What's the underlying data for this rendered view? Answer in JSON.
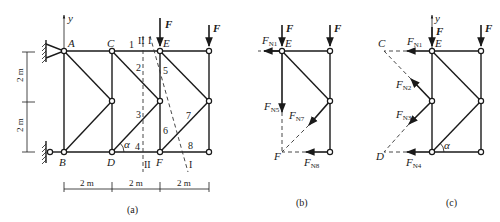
{
  "figure": {
    "panels": [
      {
        "id": "a",
        "caption": "(a)",
        "nodes": {
          "A": "A",
          "B": "B",
          "C": "C",
          "D": "D",
          "E": "E",
          "F": "F"
        },
        "axis_label": "y",
        "load_label": "F",
        "members": [
          "1",
          "2",
          "3",
          "4",
          "5",
          "6",
          "7",
          "8"
        ],
        "section_labels": {
          "I": "I",
          "II": "II"
        },
        "angle_label": "α",
        "dimensions": {
          "horizontal": [
            "2 m",
            "2 m",
            "2 m"
          ],
          "vertical": [
            "2 m",
            "2 m"
          ]
        }
      },
      {
        "id": "b",
        "caption": "(b)",
        "load_label": "F",
        "node_E": "E",
        "point_F": "F",
        "forces": {
          "N1": {
            "main": "F",
            "sub": "N1"
          },
          "N5": {
            "main": "F",
            "sub": "N5"
          },
          "N7": {
            "main": "F",
            "sub": "N7"
          },
          "N8": {
            "main": "F",
            "sub": "N8"
          }
        }
      },
      {
        "id": "c",
        "caption": "(c)",
        "axis_label": "y",
        "load_label": "F",
        "node_E": "E",
        "point_C": "C",
        "point_D": "D",
        "angle_label": "α",
        "forces": {
          "N1": {
            "main": "F",
            "sub": "N1"
          },
          "N2": {
            "main": "F",
            "sub": "N2"
          },
          "N3": {
            "main": "F",
            "sub": "N3"
          },
          "N4": {
            "main": "F",
            "sub": "N4"
          }
        }
      }
    ]
  }
}
